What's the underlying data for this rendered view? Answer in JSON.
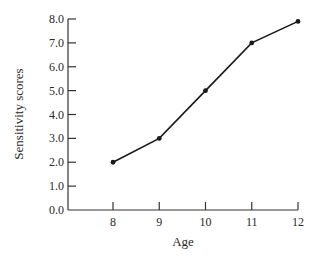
{
  "chart_data": {
    "type": "line",
    "title": "",
    "xlabel": "Age",
    "ylabel": "Sensitivity scores",
    "x": [
      8,
      9,
      10,
      11,
      12
    ],
    "series": [
      {
        "name": "Sensitivity scores",
        "values": [
          2.0,
          3.0,
          5.0,
          7.0,
          7.9
        ]
      }
    ],
    "xticks": [
      "8",
      "9",
      "10",
      "11",
      "12"
    ],
    "yticks": [
      "0.0",
      "1.0",
      "2.0",
      "3.0",
      "4.0",
      "5.0",
      "6.0",
      "7.0",
      "8.0"
    ],
    "ylim": [
      0,
      8
    ],
    "xlim": [
      7,
      12
    ],
    "grid": false,
    "legend": "none",
    "colors": {
      "line": "#1a1a1a",
      "axis": "#333333"
    }
  }
}
